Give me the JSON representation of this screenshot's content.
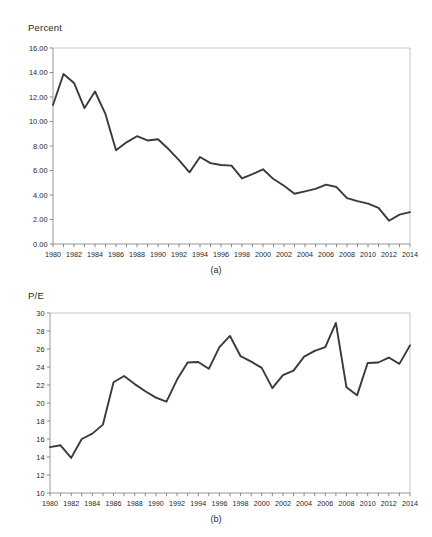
{
  "figure": {
    "panel_a_caption": "(a)",
    "panel_b_caption": "(b)",
    "line_color": "#3a3a3a",
    "axis_color": "#8d8d8d",
    "background_color": "#ffffff"
  },
  "chart_data": [
    {
      "type": "line",
      "title": "",
      "panel": "(a)",
      "ylabel": "Percent",
      "xlabel": "",
      "ylim": [
        0,
        16
      ],
      "xlim": [
        1980,
        2014
      ],
      "ytick_step": 2,
      "ytick_labels": [
        "0.00",
        "2.00",
        "4.00",
        "6.00",
        "8.00",
        "10.00",
        "12.00",
        "14.00",
        "16.00"
      ],
      "ytick_values": [
        0,
        2,
        4,
        6,
        8,
        10,
        12,
        14,
        16
      ],
      "xtick_labels": [
        "1980",
        "1982",
        "1984",
        "1986",
        "1988",
        "1990",
        "1992",
        "1994",
        "1996",
        "1998",
        "2000",
        "2002",
        "2004",
        "2006",
        "2008",
        "2010",
        "2012",
        "2014"
      ],
      "xtick_values": [
        1980,
        1982,
        1984,
        1986,
        1988,
        1990,
        1992,
        1994,
        1996,
        1998,
        2000,
        2002,
        2004,
        2006,
        2008,
        2010,
        2012,
        2014
      ],
      "minor_xticks_every": 1,
      "grid": false,
      "legend": false,
      "x": [
        1980,
        1981,
        1982,
        1983,
        1984,
        1985,
        1986,
        1987,
        1988,
        1989,
        1990,
        1991,
        1992,
        1993,
        1994,
        1995,
        1996,
        1997,
        1998,
        1999,
        2000,
        2001,
        2002,
        2003,
        2004,
        2005,
        2006,
        2007,
        2008,
        2009,
        2010,
        2011,
        2012,
        2013,
        2014
      ],
      "values": [
        11.35,
        13.88,
        13.15,
        11.1,
        12.45,
        10.6,
        7.65,
        8.3,
        8.8,
        8.45,
        8.55,
        7.75,
        6.85,
        5.85,
        7.1,
        6.6,
        6.45,
        6.4,
        5.35,
        5.7,
        6.1,
        5.3,
        4.75,
        4.1,
        4.3,
        4.5,
        4.85,
        4.65,
        3.75,
        3.5,
        3.3,
        2.95,
        1.9,
        2.4,
        2.6
      ]
    },
    {
      "type": "line",
      "title": "",
      "panel": "(b)",
      "ylabel": "P/E",
      "xlabel": "",
      "ylim": [
        10,
        30
      ],
      "xlim": [
        1980,
        2014
      ],
      "ytick_step": 2,
      "ytick_labels": [
        "10",
        "12",
        "14",
        "16",
        "18",
        "20",
        "22",
        "24",
        "26",
        "28",
        "30"
      ],
      "ytick_values": [
        10,
        12,
        14,
        16,
        18,
        20,
        22,
        24,
        26,
        28,
        30
      ],
      "xtick_labels": [
        "1980",
        "1982",
        "1984",
        "1986",
        "1988",
        "1990",
        "1992",
        "1994",
        "1996",
        "1998",
        "2000",
        "2002",
        "2004",
        "2006",
        "2008",
        "2010",
        "2012",
        "2014"
      ],
      "xtick_values": [
        1980,
        1982,
        1984,
        1986,
        1988,
        1990,
        1992,
        1994,
        1996,
        1998,
        2000,
        2002,
        2004,
        2006,
        2008,
        2010,
        2012,
        2014
      ],
      "minor_xticks_every": 1,
      "grid": false,
      "legend": false,
      "x": [
        1980,
        1981,
        1982,
        1983,
        1984,
        1985,
        1986,
        1987,
        1988,
        1989,
        1990,
        1991,
        1992,
        1993,
        1994,
        1995,
        1996,
        1997,
        1998,
        1999,
        2000,
        2001,
        2002,
        2003,
        2004,
        2005,
        2006,
        2007,
        2008,
        2009,
        2010,
        2011,
        2012,
        2013,
        2014
      ],
      "values": [
        15.1,
        15.3,
        13.9,
        16.0,
        16.6,
        17.6,
        22.3,
        23.0,
        22.1,
        21.3,
        20.6,
        20.15,
        22.6,
        24.5,
        24.55,
        23.8,
        26.2,
        27.45,
        25.2,
        24.6,
        23.9,
        21.65,
        23.1,
        23.6,
        25.15,
        25.8,
        26.2,
        28.9,
        21.75,
        20.85,
        24.45,
        24.5,
        25.05,
        24.35,
        26.4
      ]
    }
  ]
}
